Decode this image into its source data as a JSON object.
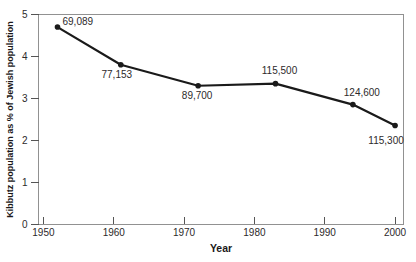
{
  "chart_data": {
    "type": "line",
    "title": "",
    "xlabel": "Year",
    "ylabel": "Kibbutz population as % of Jewish population",
    "x": [
      1952,
      1961,
      1972,
      1983,
      1994,
      2000
    ],
    "y": [
      4.7,
      3.8,
      3.3,
      3.35,
      2.85,
      2.35
    ],
    "point_labels": [
      "69,089",
      "77,153",
      "89,700",
      "115,500",
      "124,600",
      "115,300"
    ],
    "x_ticks": [
      "1950",
      "1960",
      "1970",
      "1980",
      "1990",
      "2000"
    ],
    "y_ticks": [
      "0",
      "1",
      "2",
      "3",
      "4",
      "5"
    ],
    "xlim": [
      1949.3,
      2001.2
    ],
    "ylim": [
      0,
      5
    ],
    "grid": false,
    "legend": "none",
    "colors": {
      "line": "#1a1a1a",
      "marker": "#1a1a1a",
      "frame": "#919191",
      "tick": "#555555",
      "text": "#2d2a2b"
    }
  }
}
